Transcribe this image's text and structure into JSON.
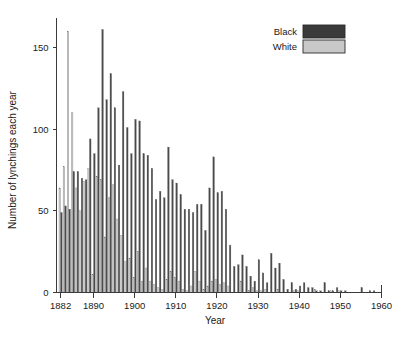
{
  "chart_data": {
    "type": "bar",
    "title": "",
    "xlabel": "Year",
    "ylabel": "Number of lynchings each year",
    "xlim": [
      1881,
      1960
    ],
    "ylim": [
      0,
      168
    ],
    "xticks": [
      1882,
      1890,
      1900,
      1910,
      1920,
      1930,
      1940,
      1950,
      1960
    ],
    "yticks": [
      0,
      50,
      100,
      150
    ],
    "grid": false,
    "legend_position": "top-right",
    "legend": [
      {
        "name": "Black",
        "color": "#3a3a3a"
      },
      {
        "name": "White",
        "color": "#c8c8c8"
      }
    ],
    "x": [
      1882,
      1883,
      1884,
      1885,
      1886,
      1887,
      1888,
      1889,
      1890,
      1891,
      1892,
      1893,
      1894,
      1895,
      1896,
      1897,
      1898,
      1899,
      1900,
      1901,
      1902,
      1903,
      1904,
      1905,
      1906,
      1907,
      1908,
      1909,
      1910,
      1911,
      1912,
      1913,
      1914,
      1915,
      1916,
      1917,
      1918,
      1919,
      1920,
      1921,
      1922,
      1923,
      1924,
      1925,
      1926,
      1927,
      1928,
      1929,
      1930,
      1931,
      1932,
      1933,
      1934,
      1935,
      1936,
      1937,
      1938,
      1939,
      1940,
      1941,
      1942,
      1943,
      1944,
      1945,
      1946,
      1947,
      1948,
      1949,
      1950,
      1951,
      1952,
      1953,
      1954,
      1955,
      1956,
      1957,
      1958
    ],
    "series": [
      {
        "name": "Black",
        "color": "#4a4a4a",
        "values": [
          49,
          53,
          51,
          74,
          74,
          70,
          69,
          94,
          85,
          113,
          161,
          118,
          134,
          113,
          78,
          123,
          101,
          85,
          106,
          105,
          85,
          84,
          76,
          57,
          62,
          58,
          89,
          69,
          67,
          60,
          51,
          51,
          49,
          54,
          54,
          38,
          64,
          83,
          61,
          62,
          51,
          29,
          16,
          17,
          23,
          16,
          10,
          7,
          20,
          12,
          6,
          24,
          15,
          18,
          8,
          2,
          6,
          2,
          4,
          6,
          3,
          3,
          1,
          1,
          6,
          1,
          1,
          3,
          1,
          1,
          0,
          0,
          0,
          3,
          0,
          1,
          1
        ]
      },
      {
        "name": "White",
        "color": "#c8c8c8",
        "values": [
          64,
          77,
          160,
          110,
          64,
          50,
          68,
          76,
          11,
          71,
          69,
          34,
          58,
          66,
          45,
          35,
          19,
          21,
          9,
          25,
          7,
          15,
          7,
          5,
          3,
          2,
          8,
          13,
          9,
          7,
          2,
          1,
          4,
          13,
          7,
          2,
          4,
          7,
          8,
          5,
          6,
          4,
          0,
          0,
          7,
          0,
          1,
          3,
          1,
          1,
          2,
          0,
          0,
          2,
          0,
          0,
          0,
          1,
          1,
          0,
          0,
          0,
          2,
          0,
          0,
          0,
          1,
          0,
          1,
          0,
          0,
          0,
          0,
          0,
          0,
          0,
          0
        ]
      }
    ]
  }
}
